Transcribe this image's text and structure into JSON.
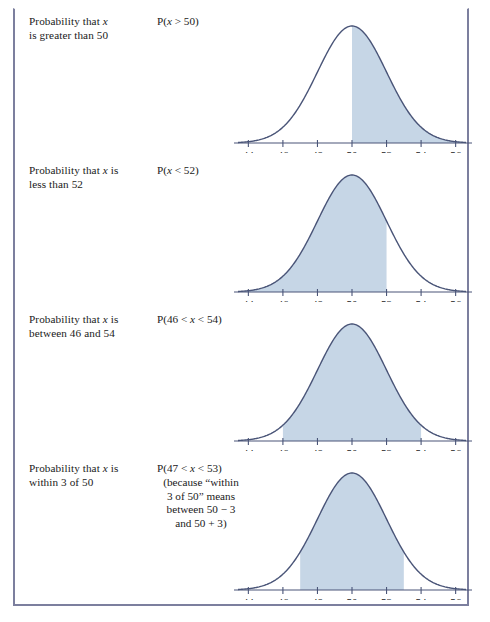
{
  "figure": {
    "border_color": "#7c7f9e",
    "curve_color": "#4a5578",
    "fill_color": "#c6d6e6",
    "axis_color": "#4a5578"
  },
  "panels": [
    {
      "description_line1": "Probability that x",
      "description_line2": "is greater than 50",
      "description_italic_var": "x",
      "formula": "P(x > 50)",
      "formula_lines": [
        "P(x > 50)"
      ],
      "chart": {
        "ticks": [
          "44",
          "46",
          "48",
          "50",
          "52",
          "54",
          "56"
        ],
        "shade_from": 50,
        "shade_to": 56.6
      }
    },
    {
      "description_line1": "Probability that x is",
      "description_line2": "less than 52",
      "description_italic_var": "x",
      "formula": "P(x < 52)",
      "formula_lines": [
        "P(x < 52)"
      ],
      "chart": {
        "ticks": [
          "44",
          "46",
          "48",
          "50",
          "52",
          "54",
          "56"
        ],
        "shade_from": 43.4,
        "shade_to": 52
      }
    },
    {
      "description_line1": "Probability that x is",
      "description_line2": "between 46 and 54",
      "description_italic_var": "x",
      "formula": "P(46 < x < 54)",
      "formula_lines": [
        "P(46 < x < 54)"
      ],
      "chart": {
        "ticks": [
          "44",
          "46",
          "48",
          "50",
          "52",
          "54",
          "56"
        ],
        "shade_from": 46,
        "shade_to": 54
      }
    },
    {
      "description_line1": "Probability that x is",
      "description_line2": "within 3 of 50",
      "description_italic_var": "x",
      "formula": "P(47 < x < 53)",
      "formula_lines": [
        "P(47 < x < 53)",
        "(because “within",
        "3 of 50” means",
        "between 50 − 3",
        "and 50 + 3)"
      ],
      "chart": {
        "ticks": [
          "44",
          "46",
          "48",
          "50",
          "52",
          "54",
          "56"
        ],
        "shade_from": 47,
        "shade_to": 53
      }
    }
  ],
  "chart_data": {
    "type": "area",
    "title": "",
    "xlabel": "",
    "ylabel": "",
    "xlim": [
      43.4,
      56.6
    ],
    "ylim": [
      0,
      1
    ],
    "grid": false,
    "legend": "none",
    "distribution": {
      "kind": "normal",
      "mean": 50,
      "sd": 2
    },
    "x_ticks": [
      44,
      46,
      48,
      50,
      52,
      54,
      56
    ],
    "x_tick_labels": [
      "44",
      "46",
      "48",
      "50",
      "52",
      "54",
      "56"
    ],
    "panels": [
      {
        "label": "Probability that x is greater than 50",
        "notation": "P(x > 50)",
        "shaded_interval": [
          50,
          56.6
        ],
        "shade_description": "right tail from 50"
      },
      {
        "label": "Probability that x is less than 52",
        "notation": "P(x < 52)",
        "shaded_interval": [
          43.4,
          52
        ],
        "shade_description": "left tail up to 52"
      },
      {
        "label": "Probability that x is between 46 and 54",
        "notation": "P(46 < x < 54)",
        "shaded_interval": [
          46,
          54
        ],
        "shade_description": "central band 46 to 54"
      },
      {
        "label": "Probability that x is within 3 of 50",
        "notation": "P(47 < x < 53)",
        "shaded_interval": [
          47,
          53
        ],
        "shade_description": "central band 47 to 53"
      }
    ]
  }
}
